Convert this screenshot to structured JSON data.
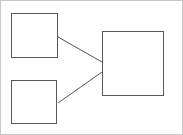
{
  "canvas": {
    "width": 183,
    "height": 135,
    "background_color": "#ffffff",
    "border_color": "#c8c8c8",
    "border_width": 1
  },
  "style": {
    "node_stroke_color": "#595959",
    "node_stroke_width": 1,
    "node_fill_color": "#ffffff",
    "edge_stroke_color": "#555555",
    "edge_stroke_width": 1
  },
  "diagram": {
    "title": "",
    "type": "node-link-diagram",
    "node_count": 3,
    "edge_count": 2,
    "nodes": [
      {
        "id": "node-top-left",
        "name": "small-square-top-left",
        "label": "",
        "shape": "rectangle",
        "x": 11,
        "y": 13,
        "width": 47,
        "height": 45
      },
      {
        "id": "node-bottom-left",
        "name": "small-square-bottom-left",
        "label": "",
        "shape": "rectangle",
        "x": 11,
        "y": 80,
        "width": 46,
        "height": 44
      },
      {
        "id": "node-right",
        "name": "large-square-right",
        "label": "",
        "shape": "rectangle",
        "x": 102,
        "y": 31,
        "width": 62,
        "height": 65
      }
    ],
    "edges": [
      {
        "id": "edge-top",
        "name": "connector-top-left-to-right",
        "from": "node-top-left",
        "to": "node-right",
        "x1": 58,
        "y1": 37,
        "x2": 102,
        "y2": 62,
        "label": ""
      },
      {
        "id": "edge-bottom",
        "name": "connector-bottom-left-to-right",
        "from": "node-bottom-left",
        "to": "node-right",
        "x1": 58,
        "y1": 103,
        "x2": 102,
        "y2": 72,
        "label": ""
      }
    ]
  }
}
